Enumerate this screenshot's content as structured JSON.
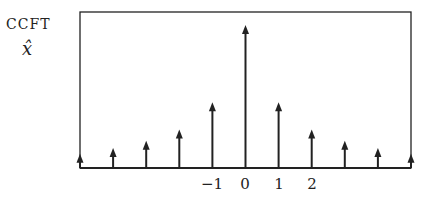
{
  "labels": {
    "title": "CCFT",
    "symbol": "x̂"
  },
  "chart_data": {
    "type": "stem",
    "xlabel": "",
    "ylabel": "",
    "tick_labels": [
      "−1",
      "0",
      "1",
      "2"
    ],
    "x": [
      -5,
      -4,
      -3,
      -2,
      -1,
      0,
      1,
      2,
      3,
      4,
      5
    ],
    "values": [
      0.1,
      0.14,
      0.19,
      0.27,
      0.46,
      1.0,
      0.46,
      0.27,
      0.19,
      0.14,
      0.1
    ],
    "grid": false,
    "legend": null
  },
  "colors": {
    "line": "#222222",
    "background": "#ffffff"
  }
}
